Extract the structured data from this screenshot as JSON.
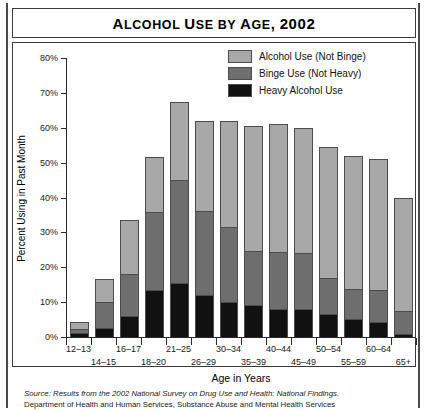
{
  "title": "Alcohol Use by Age, 2002",
  "legend": {
    "position": "top-right",
    "items": [
      {
        "label": "Alcohol Use (Not Binge)",
        "color": "#a8a8a8",
        "key": "alcohol_not_binge"
      },
      {
        "label": "Binge Use (Not Heavy)",
        "color": "#6e6e6e",
        "key": "binge_not_heavy"
      },
      {
        "label": "Heavy Alcohol Use",
        "color": "#111111",
        "key": "heavy"
      }
    ]
  },
  "source": {
    "line1_italic": "Source: Results from the 2002 National Survey on Drug Use and Health: National Findings.",
    "line2": "Department of Health and Human Services, Substance Abuse and Mental Health Services"
  },
  "chart_data": {
    "type": "bar",
    "stacked": true,
    "title": "Alcohol Use by Age, 2002",
    "xlabel": "Age in Years",
    "ylabel": "Percent Using in Past Month",
    "ylim": [
      0,
      80
    ],
    "yticks": [
      "0%",
      "10%",
      "20%",
      "30%",
      "40%",
      "50%",
      "60%",
      "70%",
      "80%"
    ],
    "ytick_values": [
      0,
      10,
      20,
      30,
      40,
      50,
      60,
      70,
      80
    ],
    "grid": false,
    "categories": [
      "12–13",
      "14–15",
      "16–17",
      "18–20",
      "21–25",
      "26–29",
      "30–34",
      "35–39",
      "40–44",
      "45–49",
      "50–54",
      "55–59",
      "60–64",
      "65+"
    ],
    "series": [
      {
        "name": "Heavy Alcohol Use",
        "color": "#111111",
        "values": [
          1.0,
          2.5,
          6.0,
          13.5,
          15.5,
          12.0,
          10.0,
          9.0,
          8.0,
          8.0,
          6.5,
          5.0,
          4.0,
          0.5
        ]
      },
      {
        "name": "Binge Use (Not Heavy)",
        "color": "#6e6e6e",
        "values": [
          1.3,
          7.5,
          12.0,
          22.5,
          29.5,
          24.0,
          21.5,
          15.5,
          16.0,
          16.0,
          10.0,
          8.5,
          9.0,
          6.5
        ]
      },
      {
        "name": "Alcohol Use (Not Binge)",
        "color": "#a8a8a8",
        "values": [
          2.0,
          6.5,
          15.5,
          15.5,
          22.5,
          26.0,
          30.5,
          36.0,
          37.0,
          36.0,
          38.0,
          38.5,
          38.0,
          33.0
        ]
      }
    ],
    "totals": [
      4.3,
      16.5,
      33.5,
      51.5,
      67.5,
      62.0,
      62.0,
      60.5,
      61.0,
      60.0,
      54.5,
      52.0,
      51.0,
      40.0
    ]
  }
}
